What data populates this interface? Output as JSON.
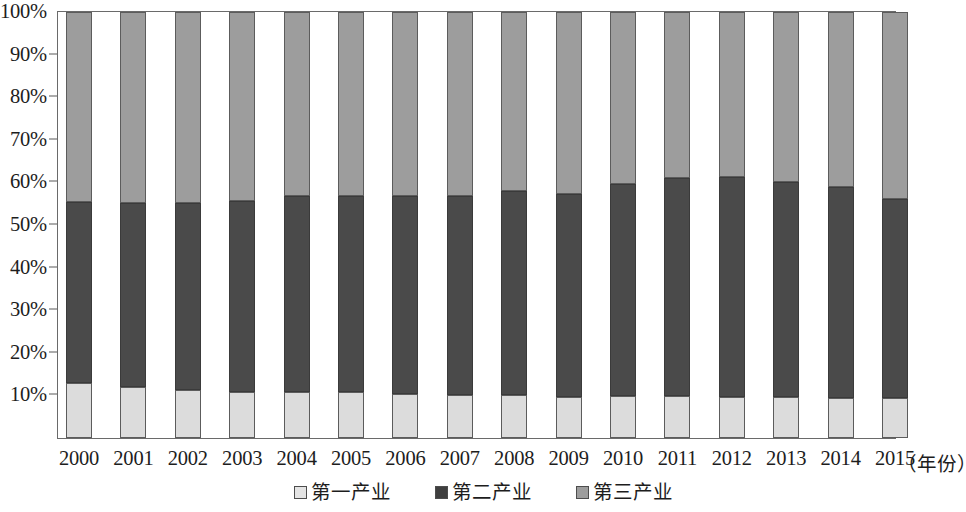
{
  "chart_data": {
    "type": "bar",
    "subtype": "100% stacked column",
    "title": "",
    "xlabel": "（年份）",
    "ylabel": "",
    "ylim": [
      0,
      100
    ],
    "yunit": "%",
    "grid": false,
    "legend_position": "bottom-center",
    "categories": [
      "2000",
      "2001",
      "2002",
      "2003",
      "2004",
      "2005",
      "2006",
      "2007",
      "2008",
      "2009",
      "2010",
      "2011",
      "2012",
      "2013",
      "2014",
      "2015"
    ],
    "ytick_labels": [
      "10%",
      "20%",
      "30%",
      "40%",
      "50%",
      "60%",
      "70%",
      "80%",
      "90%",
      "100%"
    ],
    "ytick_values": [
      10,
      20,
      30,
      40,
      50,
      60,
      70,
      80,
      90,
      100
    ],
    "series": [
      {
        "name": "第一产业",
        "color": "#dcdcdc",
        "values": [
          12.8,
          12.0,
          11.3,
          10.9,
          10.9,
          10.7,
          10.3,
          10.2,
          10.1,
          9.7,
          9.9,
          9.8,
          9.6,
          9.7,
          9.3,
          9.5
        ]
      },
      {
        "name": "第二产业",
        "color": "#4a4a4a",
        "values": [
          42.6,
          43.2,
          43.9,
          44.7,
          45.9,
          46.1,
          46.6,
          46.7,
          47.9,
          47.6,
          49.7,
          51.2,
          51.6,
          50.3,
          49.7,
          46.5
        ]
      },
      {
        "name": "第三产业",
        "color": "#9d9d9d",
        "values": [
          44.6,
          44.8,
          44.8,
          44.4,
          43.2,
          43.2,
          43.1,
          43.1,
          42.0,
          42.7,
          40.4,
          39.0,
          38.8,
          40.0,
          41.0,
          44.0
        ]
      }
    ]
  },
  "legend": {
    "items": [
      {
        "label": "第一产业",
        "swatch": "light-gray-swatch"
      },
      {
        "label": "第二产业",
        "swatch": "dark-gray-swatch"
      },
      {
        "label": "第三产业",
        "swatch": "medium-gray-swatch"
      }
    ]
  },
  "axis": {
    "x_title": "（年份）"
  },
  "colors": {
    "primary_industry": "#dcdcdc",
    "secondary_industry": "#4a4a4a",
    "tertiary_industry": "#9d9d9d",
    "frame": "#6a6a6a",
    "text": "#1d1d1d"
  }
}
